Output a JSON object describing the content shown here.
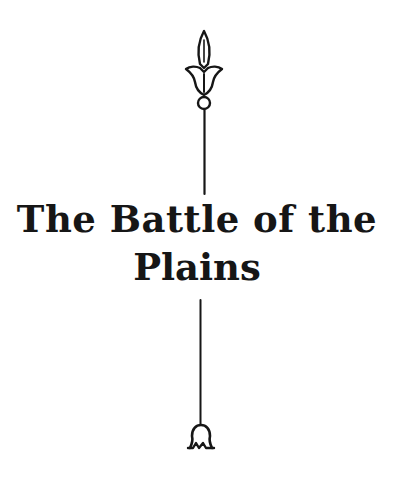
{
  "page": {
    "title_lines": [
      "The Battle of the",
      "Plains"
    ],
    "ornaments": {
      "top": "lily-finial-icon",
      "bottom": "bell-drop-icon"
    },
    "colors": {
      "ink": "#161616",
      "paper": "#ffffff"
    }
  }
}
